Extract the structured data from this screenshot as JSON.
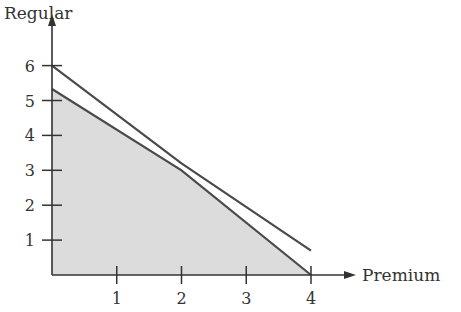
{
  "chart_data": {
    "type": "line",
    "title": "",
    "xlabel": "Premium",
    "ylabel": "Regular",
    "x_ticks": [
      1,
      2,
      3,
      4
    ],
    "y_ticks": [
      1,
      2,
      3,
      4,
      5,
      6
    ],
    "xlim": [
      0,
      4.6
    ],
    "ylim": [
      0,
      6.6
    ],
    "grid": false,
    "legend": null,
    "series": [
      {
        "name": "upper constraint line",
        "points": [
          [
            0,
            6
          ],
          [
            2,
            3.2
          ],
          [
            4,
            0.7
          ]
        ]
      },
      {
        "name": "feasible region boundary",
        "points": [
          [
            0,
            5.33
          ],
          [
            2,
            3
          ],
          [
            4,
            0
          ]
        ]
      }
    ],
    "shaded_region": {
      "description": "feasible region",
      "vertices": [
        [
          0,
          0
        ],
        [
          0,
          5.33
        ],
        [
          2,
          3
        ],
        [
          4,
          0
        ]
      ],
      "color": "#dcdcdc"
    },
    "colors": {
      "lines": "#4a4a4a",
      "axes": "#333333",
      "fill": "#dcdcdc"
    }
  }
}
